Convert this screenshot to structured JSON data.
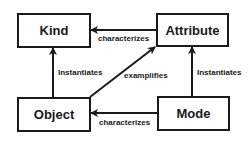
{
  "diagram": {
    "nodes": [
      {
        "id": "kind",
        "label": "Kind"
      },
      {
        "id": "attribute",
        "label": "Attribute"
      },
      {
        "id": "object",
        "label": "Object"
      },
      {
        "id": "mode",
        "label": "Mode"
      }
    ],
    "edges": [
      {
        "from": "attribute",
        "to": "kind",
        "label": "characterizes"
      },
      {
        "from": "object",
        "to": "kind",
        "label": "Instantiates"
      },
      {
        "from": "object",
        "to": "attribute",
        "label": "examplifies"
      },
      {
        "from": "mode",
        "to": "attribute",
        "label": "Instantiates"
      },
      {
        "from": "mode",
        "to": "object",
        "label": "characterizes"
      }
    ],
    "stroke_color": "#1a1a1a",
    "background_color": "#ffffff"
  }
}
